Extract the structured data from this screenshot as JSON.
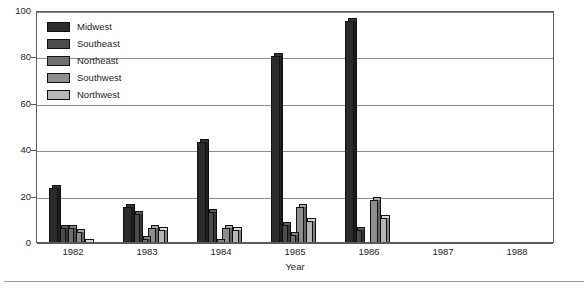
{
  "chart_data": {
    "type": "bar",
    "title": "",
    "subtitle": "",
    "xlabel": "Year",
    "ylabel": "",
    "categories": [
      "1982",
      "1983",
      "1984",
      "1985",
      "1986",
      "1987",
      "1988"
    ],
    "series": [
      {
        "name": "Midwest",
        "color": "#2b2b2b",
        "values": [
          24,
          16,
          44,
          81,
          96,
          0,
          0
        ]
      },
      {
        "name": "Southeast",
        "color": "#4c4c4c",
        "values": [
          7,
          13,
          14,
          8,
          6,
          0,
          0
        ]
      },
      {
        "name": "Northeast",
        "color": "#6f6f6f",
        "values": [
          7,
          2,
          1,
          4,
          0,
          0,
          0
        ]
      },
      {
        "name": "Southwest",
        "color": "#8d8d8d",
        "values": [
          5,
          7,
          7,
          16,
          19,
          0,
          0
        ]
      },
      {
        "name": "Northwest",
        "color": "#b6b6b6",
        "values": [
          1,
          6,
          6,
          10,
          11,
          0,
          0
        ]
      }
    ],
    "ylim": [
      0,
      100
    ],
    "yticks": [
      0,
      20,
      40,
      60,
      80,
      100
    ],
    "ytick_labels": [
      "0",
      "20",
      "40",
      "60",
      "80",
      "100"
    ],
    "grid": true,
    "grid_axis": "y",
    "legend_position": "upper-left-inside",
    "bar_style": "3d-extruded",
    "frame": true
  },
  "legend": {
    "entries": [
      {
        "label": "Midwest"
      },
      {
        "label": "Southeast"
      },
      {
        "label": "Northeast"
      },
      {
        "label": "Southwest"
      },
      {
        "label": "Northwest"
      }
    ]
  },
  "axis": {
    "x_title": "Year"
  }
}
